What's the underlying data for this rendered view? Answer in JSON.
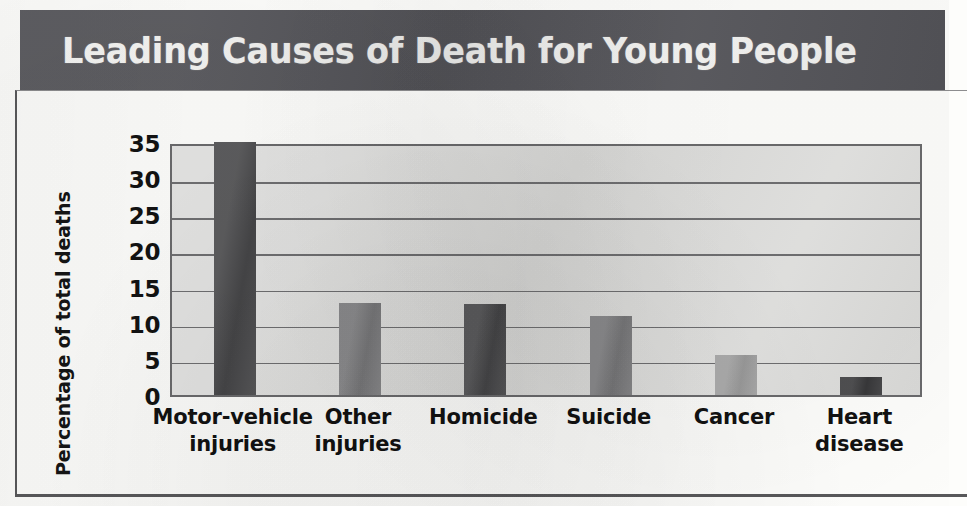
{
  "title": "Leading Causes of Death for Young People",
  "colors": {
    "banner": "#55555a",
    "banner_text": "#f4f4f2",
    "plot_background": "#dddddb",
    "plot_border": "#6a6a6c",
    "gridline": "#6f6f71",
    "bar_dark": "#4a4a4c",
    "bar_medium": "#7e7e80",
    "bar_light": "#a3a3a3",
    "frame": "#58585a"
  },
  "chart_data": {
    "type": "bar",
    "title": "Leading Causes of Death for Young People",
    "xlabel": "",
    "ylabel": "Percentage of total deaths",
    "categories": [
      "Motor-vehicle injuries",
      "Other injuries",
      "Homicide",
      "Suicide",
      "Cancer",
      "Heart disease"
    ],
    "category_lines": [
      [
        "Motor-vehicle",
        "injuries"
      ],
      [
        "Other",
        "injuries"
      ],
      [
        "Homicide",
        ""
      ],
      [
        "Suicide",
        ""
      ],
      [
        "Cancer",
        ""
      ],
      [
        "Heart",
        "disease"
      ]
    ],
    "values": [
      35,
      12.7,
      12.6,
      11,
      5.5,
      2.5
    ],
    "bar_colors": [
      "#4a4a4c",
      "#7e7e80",
      "#4a4a4c",
      "#7e7e80",
      "#a3a3a3",
      "#3b3b3d"
    ],
    "ylim": [
      0,
      35
    ],
    "yticks": [
      0,
      5,
      10,
      15,
      20,
      25,
      30,
      35
    ],
    "ytick_labels": [
      "0",
      "5",
      "10",
      "15",
      "20",
      "25",
      "30",
      "35"
    ],
    "grid": true,
    "legend": false
  }
}
